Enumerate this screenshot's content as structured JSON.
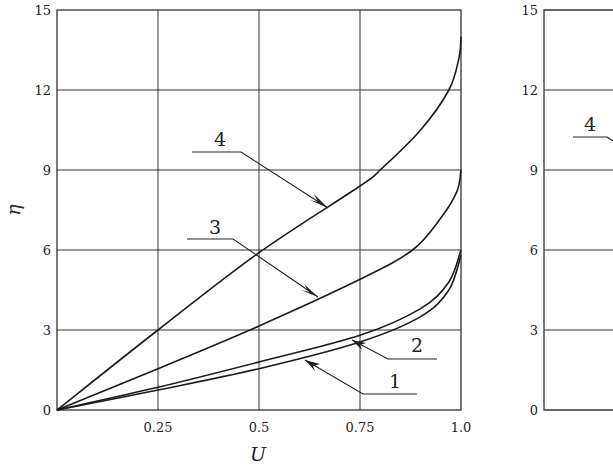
{
  "chart_data": [
    {
      "type": "line",
      "title": "",
      "xlabel": "U",
      "ylabel": "η",
      "xlim": [
        0,
        1.0
      ],
      "ylim": [
        0,
        15
      ],
      "grid": true,
      "x_ticks": [
        "0.25",
        "0.5",
        "0.75",
        "1.0"
      ],
      "y_ticks": [
        "0",
        "3",
        "6",
        "9",
        "12",
        "15"
      ],
      "legend": "none (curves labeled 1–4 with leader arrows)",
      "series": [
        {
          "name": "1",
          "points": [
            [
              0,
              0
            ],
            [
              0.25,
              0.75
            ],
            [
              0.5,
              1.55
            ],
            [
              0.75,
              2.55
            ],
            [
              0.9,
              3.5
            ],
            [
              0.97,
              4.5
            ],
            [
              1.0,
              5.8
            ]
          ]
        },
        {
          "name": "2",
          "points": [
            [
              0,
              0
            ],
            [
              0.25,
              0.85
            ],
            [
              0.5,
              1.8
            ],
            [
              0.75,
              2.8
            ],
            [
              0.9,
              3.8
            ],
            [
              0.97,
              4.8
            ],
            [
              1.0,
              6.0
            ]
          ]
        },
        {
          "name": "3",
          "points": [
            [
              0,
              0
            ],
            [
              0.25,
              1.55
            ],
            [
              0.5,
              3.15
            ],
            [
              0.75,
              4.9
            ],
            [
              0.88,
              6.0
            ],
            [
              0.95,
              7.2
            ],
            [
              0.99,
              8.2
            ],
            [
              1.0,
              9.0
            ]
          ]
        },
        {
          "name": "4",
          "points": [
            [
              0,
              0
            ],
            [
              0.25,
              3.0
            ],
            [
              0.5,
              5.9
            ],
            [
              0.75,
              8.4
            ],
            [
              0.8,
              9.0
            ],
            [
              0.9,
              10.5
            ],
            [
              0.97,
              12.0
            ],
            [
              0.995,
              13.2
            ],
            [
              1.0,
              14.0
            ]
          ]
        }
      ]
    },
    {
      "type": "line",
      "title": "",
      "note": "second panel, partially visible (cropped at right edge)",
      "ylim": [
        0,
        15
      ],
      "y_ticks": [
        "0",
        "3",
        "6",
        "9",
        "12",
        "15"
      ],
      "grid": true,
      "series_labels_visible": [
        "4"
      ]
    }
  ],
  "labels": {
    "xlabel": "U",
    "ylabel": "η",
    "x_ticks": [
      "0.25",
      "0.5",
      "0.75",
      "1.0"
    ],
    "y_ticks": [
      "0",
      "3",
      "6",
      "9",
      "12",
      "15"
    ],
    "curve_labels": [
      "1",
      "2",
      "3",
      "4"
    ],
    "panel2_label": "4"
  },
  "colors": {
    "line": "#1a1a1a",
    "grid": "#333333",
    "background": "#ffffff"
  }
}
